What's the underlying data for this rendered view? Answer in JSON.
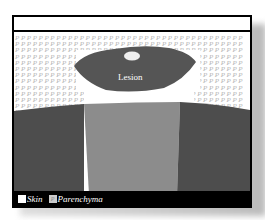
{
  "diagram": {
    "lesion_label": "Lesion",
    "pattern_glyph": "P",
    "legend": {
      "items": [
        {
          "label": "Skin",
          "swatch_color": "#ffffff"
        },
        {
          "label": "Parenchyma",
          "swatch_color": "#cccccc",
          "swatch_glyph": "P"
        }
      ]
    },
    "colors": {
      "lesion": "#555555",
      "tissue_dark": "#4d4d4d",
      "beam_channel": "#8c8c8c",
      "legend_bar": "#000000",
      "frame": "#000000"
    }
  }
}
